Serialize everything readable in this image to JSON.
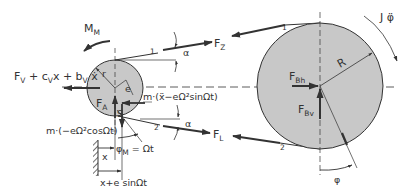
{
  "diagram": {
    "type": "belt-drive free-body diagram",
    "colors": {
      "line": "#333333",
      "pulley_fill": "#c8c8c8",
      "background": "#ffffff"
    },
    "small_pulley": {
      "radius_label": "r",
      "eccentricity_label": "e",
      "center_label": "S",
      "force_label": "F",
      "force_sub": "A",
      "moment_label": "M",
      "moment_sub": "M"
    },
    "large_pulley": {
      "radius_label": "R",
      "force_h_label": "F",
      "force_h_sub": "Bh",
      "force_v_label": "F",
      "force_v_sub": "Bv",
      "inertia_label": "J φ̈",
      "angle_label": "φ"
    },
    "belt": {
      "upper_force_label": "F",
      "upper_force_sub": "Z",
      "lower_force_label": "F",
      "lower_force_sub": "L",
      "angle_label": "α",
      "upper_marker": "1",
      "lower_marker": "2"
    },
    "spring_damper": {
      "label_parts": [
        "F",
        "V",
        " + c",
        "V",
        "x + b",
        "V",
        " ẋ"
      ]
    },
    "inertia_forces": {
      "horizontal": "m·(ẍ−eΩ²sinΩt)",
      "vertical": "m·(−eΩ²cosΩt)"
    },
    "kinematics": {
      "angle_label_main": "φ",
      "angle_label_sub": "M",
      "angle_rhs": " = Ωt",
      "x_label": "x",
      "x_total_label": "x+e sinΩt"
    }
  }
}
